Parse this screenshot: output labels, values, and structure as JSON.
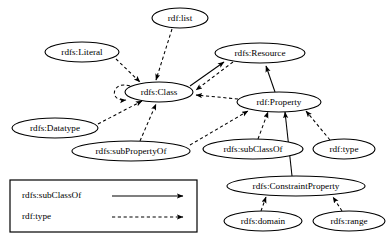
{
  "diagram": {
    "background_color": "#ffffff",
    "stroke_color": "#000000",
    "nodes": [
      {
        "id": "rdf_list",
        "label": "rdf:list",
        "cx": 180,
        "cy": 18,
        "rx": 28,
        "ry": 10
      },
      {
        "id": "rdfs_literal",
        "label": "rdfs:Literal",
        "cx": 82,
        "cy": 52,
        "rx": 37,
        "ry": 10
      },
      {
        "id": "rdfs_resource",
        "label": "rdfs:Resource",
        "cx": 260,
        "cy": 53,
        "rx": 45,
        "ry": 10
      },
      {
        "id": "rdfs_class",
        "label": "rdfs:Class",
        "cx": 159,
        "cy": 92,
        "rx": 34,
        "ry": 10
      },
      {
        "id": "rdf_property",
        "label": "rdf:Property",
        "cx": 279,
        "cy": 102,
        "rx": 42,
        "ry": 10
      },
      {
        "id": "rdfs_datatype",
        "label": "rdfs:Datatype",
        "cx": 55,
        "cy": 128,
        "rx": 43,
        "ry": 10
      },
      {
        "id": "rdfs_subpropertyof",
        "label": "rdfs:subPropertyOf",
        "cx": 131,
        "cy": 151,
        "rx": 59,
        "ry": 10
      },
      {
        "id": "rdfs_subclassof",
        "label": "rdfs:subClassOf",
        "cx": 253,
        "cy": 149,
        "rx": 50,
        "ry": 10
      },
      {
        "id": "rdf_type",
        "label": "rdf:type",
        "cx": 344,
        "cy": 149,
        "rx": 31,
        "ry": 10
      },
      {
        "id": "rdfs_constraintprop",
        "label": "rdfs:ConstraintProperty",
        "cx": 296,
        "cy": 186,
        "rx": 69,
        "ry": 10
      },
      {
        "id": "rdfs_domain",
        "label": "rdfs:domain",
        "cx": 263,
        "cy": 221,
        "rx": 39,
        "ry": 10
      },
      {
        "id": "rdfs_range",
        "label": "rdfs:range",
        "cx": 349,
        "cy": 221,
        "rx": 36,
        "ry": 10
      }
    ],
    "edges": [
      {
        "from": "rdfs_class",
        "to": "rdfs_class",
        "relation": "rdf:type",
        "style": "dashed",
        "shape": "self-loop"
      },
      {
        "from": "rdf_list",
        "to": "rdfs_class",
        "relation": "rdf:type",
        "style": "dashed"
      },
      {
        "from": "rdfs_literal",
        "to": "rdfs_class",
        "relation": "rdf:type",
        "style": "dashed"
      },
      {
        "from": "rdfs_class",
        "to": "rdfs_resource",
        "relation": "rdfs:subClassOf",
        "style": "solid"
      },
      {
        "from": "rdfs_resource",
        "to": "rdfs_class",
        "relation": "rdf:type",
        "style": "dashed"
      },
      {
        "from": "rdf_property",
        "to": "rdfs_class",
        "relation": "rdf:type",
        "style": "dashed"
      },
      {
        "from": "rdf_property",
        "to": "rdfs_resource",
        "relation": "rdfs:subClassOf",
        "style": "solid"
      },
      {
        "from": "rdfs_datatype",
        "to": "rdfs_class",
        "relation": "rdf:type",
        "style": "dashed"
      },
      {
        "from": "rdfs_subpropertyof",
        "to": "rdfs_class",
        "relation": "rdf:type",
        "style": "dashed"
      },
      {
        "from": "rdfs_subpropertyof",
        "to": "rdf_property",
        "relation": "rdf:type",
        "style": "dashed"
      },
      {
        "from": "rdfs_subclassof",
        "to": "rdf_property",
        "relation": "rdf:type",
        "style": "dashed"
      },
      {
        "from": "rdf_type",
        "to": "rdf_property",
        "relation": "rdf:type",
        "style": "dashed"
      },
      {
        "from": "rdfs_constraintprop",
        "to": "rdf_property",
        "relation": "rdfs:subClassOf",
        "style": "solid"
      },
      {
        "from": "rdfs_domain",
        "to": "rdfs_constraintprop",
        "relation": "rdf:type",
        "style": "dashed"
      },
      {
        "from": "rdfs_range",
        "to": "rdfs_constraintprop",
        "relation": "rdf:type",
        "style": "dashed"
      }
    ]
  },
  "legend": {
    "box": {
      "x": 10,
      "y": 180,
      "width": 187,
      "height": 52
    },
    "entries": [
      {
        "label": "rdfs:subClassOf",
        "style": "solid"
      },
      {
        "label": "rdf:type",
        "style": "dashed"
      }
    ]
  }
}
